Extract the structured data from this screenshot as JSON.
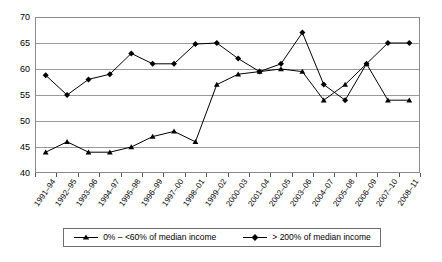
{
  "chart_data": {
    "type": "line",
    "title": "",
    "xlabel": "",
    "ylabel": "",
    "ylim": [
      40,
      70
    ],
    "ytick_step": 5,
    "yticks": [
      "40",
      "45",
      "50",
      "55",
      "60",
      "65",
      "70"
    ],
    "grid": true,
    "legend_position": "bottom",
    "categories": [
      "1991–94",
      "1992–95",
      "1993–96",
      "1994–97",
      "1995–98",
      "1996–99",
      "1997–00",
      "1998–01",
      "1999–02",
      "2000–03",
      "2001–04",
      "2002–05",
      "2003–06",
      "2004–07",
      "2005–08",
      "2006–09",
      "2007–10",
      "2008–11"
    ],
    "series": [
      {
        "name": "0% – <60% of median income",
        "marker": "triangle",
        "color": "#000000",
        "values": [
          44,
          46,
          44,
          44,
          45,
          47,
          48,
          46,
          57,
          59,
          59.5,
          60,
          59.5,
          54,
          57,
          61,
          54,
          54
        ]
      },
      {
        "name": "> 200% of median income",
        "marker": "diamond",
        "color": "#000000",
        "values": [
          58.8,
          55,
          58,
          59,
          63,
          61,
          61,
          64.8,
          65,
          62,
          59.5,
          61,
          67,
          57,
          54,
          61,
          65,
          65
        ]
      }
    ]
  },
  "legend": {
    "items": [
      {
        "label": "0% – <60% of median income",
        "marker": "triangle-marker-icon"
      },
      {
        "label": "> 200% of median income",
        "marker": "diamond-marker-icon"
      }
    ]
  }
}
